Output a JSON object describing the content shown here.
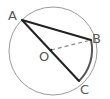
{
  "diagram": {
    "type": "geometry-circle",
    "background": "#ffffff",
    "circle": {
      "cx": 53,
      "cy": 51,
      "r": 44,
      "stroke": "#9a9a9a",
      "stroke_width": 1
    },
    "arc_bc": {
      "stroke": "#555555",
      "stroke_width": 2
    },
    "points": {
      "A": {
        "x": 22,
        "y": 20,
        "label": "A",
        "label_x": 8,
        "label_y": 20
      },
      "B": {
        "x": 91,
        "y": 40,
        "label": "B",
        "label_x": 92,
        "label_y": 43
      },
      "C": {
        "x": 79,
        "y": 81,
        "label": "C",
        "label_x": 80,
        "label_y": 94
      },
      "O": {
        "x": 51,
        "y": 50,
        "label": "O",
        "label_x": 39,
        "label_y": 61
      }
    },
    "segments": [
      {
        "from": "A",
        "to": "B",
        "style": "solid",
        "color": "#222222",
        "width": 2
      },
      {
        "from": "A",
        "to": "C",
        "style": "solid",
        "color": "#222222",
        "width": 2
      },
      {
        "from": "O",
        "to": "B",
        "style": "dashed",
        "color": "#888888",
        "width": 1.2
      }
    ]
  }
}
